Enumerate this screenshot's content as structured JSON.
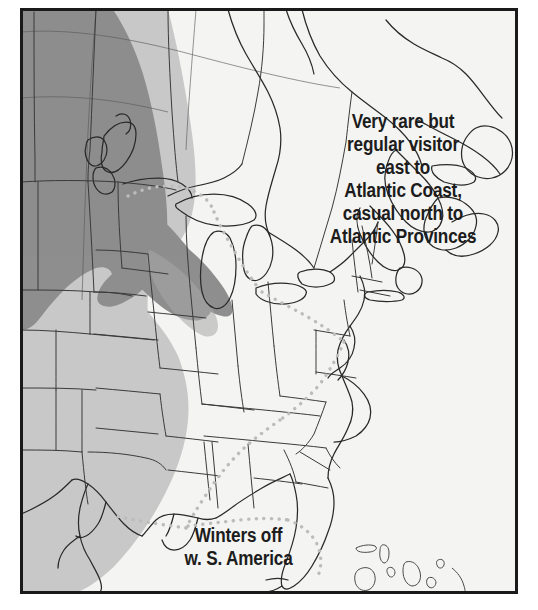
{
  "map": {
    "title": "North American Bird Range Map",
    "region": "North America — United States, southern Canada, Gulf of Mexico, Bahamas",
    "frame": {
      "border_color": "#1a1a1a",
      "border_width_px": 3,
      "inset_left_px": 20,
      "inset_top_px": 8,
      "inset_right_px": 518,
      "inset_bottom_px": 594
    },
    "background_color": "#f4f4f2",
    "annotations": [
      {
        "id": "east-note",
        "text": "Very rare but\nregular visitor\neast to\nAtlantic Coast,\ncasual north to\nAtlantic Provinces",
        "lines": [
          "Very rare but",
          "regular visitor",
          "east to",
          "Atlantic Coast,",
          "casual north to",
          "Atlantic Provinces"
        ],
        "position": "upper-right over eastern Canada / New England",
        "color": "#1c1c1c",
        "font_size_px": 19.5,
        "weight": "bold",
        "align": "center"
      },
      {
        "id": "winter-note",
        "text": "Winters off\nw. S. America",
        "lines": [
          "Winters off",
          "w. S. America"
        ],
        "position": "lower-left over Gulf of Mexico",
        "color": "#1c1c1c",
        "font_size_px": 19.5,
        "weight": "bold",
        "align": "center"
      }
    ],
    "legend_colors": {
      "breeding_range_dark_gray": "#8e8e8e",
      "migration_range_light_gray": "#c8c8c8",
      "boundary_dotted_line": "#bcbcbc",
      "coastline_stroke": "#2a2a2a",
      "state_border_stroke": "#3a3a3a",
      "ocean_land_background": "#f4f4f2"
    },
    "range_layers": [
      {
        "name": "breeding-range",
        "shade": "dark-gray",
        "color": "#8e8e8e",
        "description": "Dark gray band covering the Pacific Northwest, British Columbia, Alberta, Montana and the northern Great Plains, narrowing to a point near the Great Lakes"
      },
      {
        "name": "migration-range",
        "shade": "light-gray",
        "color": "#c8c8c8",
        "description": "Light gray band covering the western and central United States from the Canadian border south through the Great Plains to Texas and the Gulf Coast"
      },
      {
        "name": "casual-boundary",
        "shade": "dotted-line",
        "color": "#bcbcbc",
        "description": "Light gray dotted line running from the upper Midwest near Lake Superior southeast across the Ohio Valley, then south through Alabama and around the Florida peninsula and Gulf Coast"
      }
    ],
    "graticule": {
      "visible": true,
      "color": "#4a4a4a",
      "description": "Faint latitude/longitude graticule lines visible across the Canadian portion of the map"
    }
  }
}
